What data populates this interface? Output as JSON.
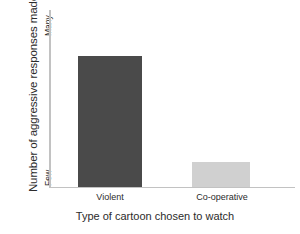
{
  "chart_data": {
    "type": "bar",
    "title": "",
    "categories": [
      "Violent",
      "Co-operative"
    ],
    "values": [
      74,
      14
    ],
    "value_unit": "percent-of-axis",
    "xlabel": "Type of cartoon chosen to watch",
    "ylabel": "Number of aggressive responses made",
    "ylim": [
      0,
      100
    ],
    "y_tick_labels": [
      "Few",
      "Many"
    ],
    "y_axis_scale": "ordinal",
    "x_tick_labels": [
      "Violent",
      "Co-operative"
    ],
    "grid": false,
    "legend": "none",
    "series": [
      {
        "name": "Number of aggressive responses made",
        "values": [
          74,
          14
        ],
        "colors": [
          "#4a4a4a",
          "#d0d0d0"
        ]
      }
    ],
    "bar_colors": {
      "violent": "#4a4a4a",
      "cooperative": "#d0d0d0"
    },
    "axis_color": "#c2c2c2",
    "background": "#ffffff",
    "text_color": "#2b2b2b"
  },
  "axes": {
    "y_title": "Number of aggressive responses made",
    "y_top_label": "Many",
    "y_bottom_label": "Few",
    "x_title": "Type of cartoon chosen to watch"
  },
  "bars": [
    {
      "label": "Violent",
      "value": 74,
      "color": "#4a4a4a"
    },
    {
      "label": "Co-operative",
      "value": 14,
      "color": "#d0d0d0"
    }
  ]
}
